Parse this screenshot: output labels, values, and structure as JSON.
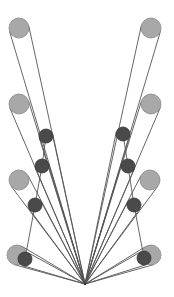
{
  "diagram": {
    "canvas": {
      "width": 174,
      "height": 297,
      "background": "#ffffff"
    },
    "colors": {
      "line": "#555555",
      "large_fill": "#a8a8a8",
      "large_stroke": "#888888",
      "small_fill": "#4a4a4a",
      "small_stroke": "#333333"
    },
    "apex": {
      "x": 85,
      "y": 284
    },
    "large_radius": 10,
    "small_radius": 7,
    "left": {
      "large": [
        {
          "x": 19,
          "y": 28
        },
        {
          "x": 19,
          "y": 104
        },
        {
          "x": 19,
          "y": 180
        },
        {
          "x": 17,
          "y": 255
        }
      ],
      "small": [
        {
          "x": 46,
          "y": 136
        },
        {
          "x": 42,
          "y": 166
        },
        {
          "x": 35,
          "y": 205
        },
        {
          "x": 25,
          "y": 259
        }
      ]
    },
    "right": {
      "large": [
        {
          "x": 151,
          "y": 28
        },
        {
          "x": 151,
          "y": 104
        },
        {
          "x": 150,
          "y": 180
        },
        {
          "x": 151,
          "y": 255
        }
      ],
      "small": [
        {
          "x": 123,
          "y": 134
        },
        {
          "x": 128,
          "y": 166
        },
        {
          "x": 134,
          "y": 205
        },
        {
          "x": 144,
          "y": 258
        }
      ]
    }
  }
}
